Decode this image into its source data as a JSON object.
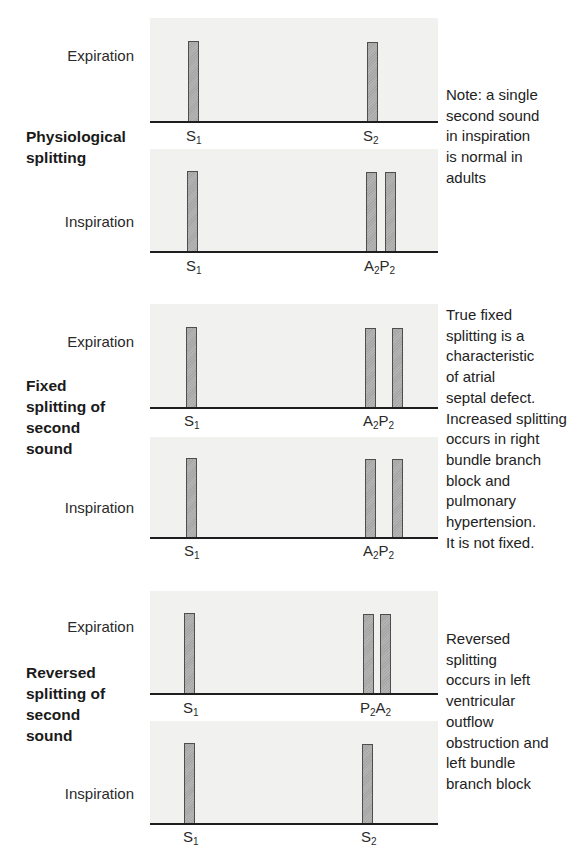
{
  "colors": {
    "panel_bg": "#f1f1f0",
    "bar_fill": "#aaaaaa",
    "bar_border": "#4e4e4e",
    "baseline": "#1e1e1e",
    "text": "#2a2a2a"
  },
  "sections": [
    {
      "title_lines": [
        "Physiological",
        "splitting"
      ],
      "note_lines": [
        "Note: a single",
        "second sound",
        "in inspiration",
        "is normal in",
        "adults"
      ],
      "rows": [
        {
          "phase": "Expiration",
          "bars": [
            {
              "name": "S1",
              "label_main": "S",
              "label_sub": "1"
            },
            {
              "name": "S2",
              "label_main": "S",
              "label_sub": "2"
            }
          ],
          "labels": [
            {
              "text": "S",
              "sub": "1"
            },
            {
              "parts": [
                {
                  "text": "S",
                  "sub": "2"
                }
              ]
            }
          ]
        },
        {
          "phase": "Inspiration",
          "bars": [
            {
              "name": "S1"
            },
            {
              "name": "A2"
            },
            {
              "name": "P2"
            }
          ],
          "labels": [
            {
              "text": "S",
              "sub": "1"
            },
            {
              "parts": [
                {
                  "text": "A",
                  "sub": "2"
                },
                {
                  "text": "P",
                  "sub": "2"
                }
              ]
            }
          ]
        }
      ]
    },
    {
      "title_lines": [
        "Fixed",
        "splitting of",
        "second",
        "sound"
      ],
      "note_lines": [
        "True fixed",
        "splitting is a",
        "characteristic",
        "of atrial",
        "septal defect.",
        "Increased splitting",
        "occurs in right",
        "bundle branch",
        "block and",
        "pulmonary",
        "hypertension.",
        "It is not fixed."
      ],
      "rows": [
        {
          "phase": "Expiration",
          "bars": [
            {
              "name": "S1"
            },
            {
              "name": "A2"
            },
            {
              "name": "P2"
            }
          ],
          "labels": [
            {
              "text": "S",
              "sub": "1"
            },
            {
              "parts": [
                {
                  "text": "A",
                  "sub": "2"
                },
                {
                  "text": "P",
                  "sub": "2"
                }
              ]
            }
          ]
        },
        {
          "phase": "Inspiration",
          "bars": [
            {
              "name": "S1"
            },
            {
              "name": "A2"
            },
            {
              "name": "P2"
            }
          ],
          "labels": [
            {
              "text": "S",
              "sub": "1"
            },
            {
              "parts": [
                {
                  "text": "A",
                  "sub": "2"
                },
                {
                  "text": "P",
                  "sub": "2"
                }
              ]
            }
          ]
        }
      ]
    },
    {
      "title_lines": [
        "Reversed",
        "splitting of",
        "second",
        "sound"
      ],
      "note_lines": [
        "Reversed",
        "splitting",
        "occurs in left",
        "ventricular",
        "outflow",
        "obstruction and",
        "left bundle",
        "branch block"
      ],
      "rows": [
        {
          "phase": "Expiration",
          "bars": [
            {
              "name": "S1"
            },
            {
              "name": "P2"
            },
            {
              "name": "A2"
            }
          ],
          "labels": [
            {
              "text": "S",
              "sub": "1"
            },
            {
              "parts": [
                {
                  "text": "P",
                  "sub": "2"
                },
                {
                  "text": "A",
                  "sub": "2"
                }
              ]
            }
          ]
        },
        {
          "phase": "Inspiration",
          "bars": [
            {
              "name": "S1"
            },
            {
              "name": "S2"
            }
          ],
          "labels": [
            {
              "text": "S",
              "sub": "1"
            },
            {
              "parts": [
                {
                  "text": "S",
                  "sub": "2"
                }
              ]
            }
          ]
        }
      ]
    }
  ]
}
